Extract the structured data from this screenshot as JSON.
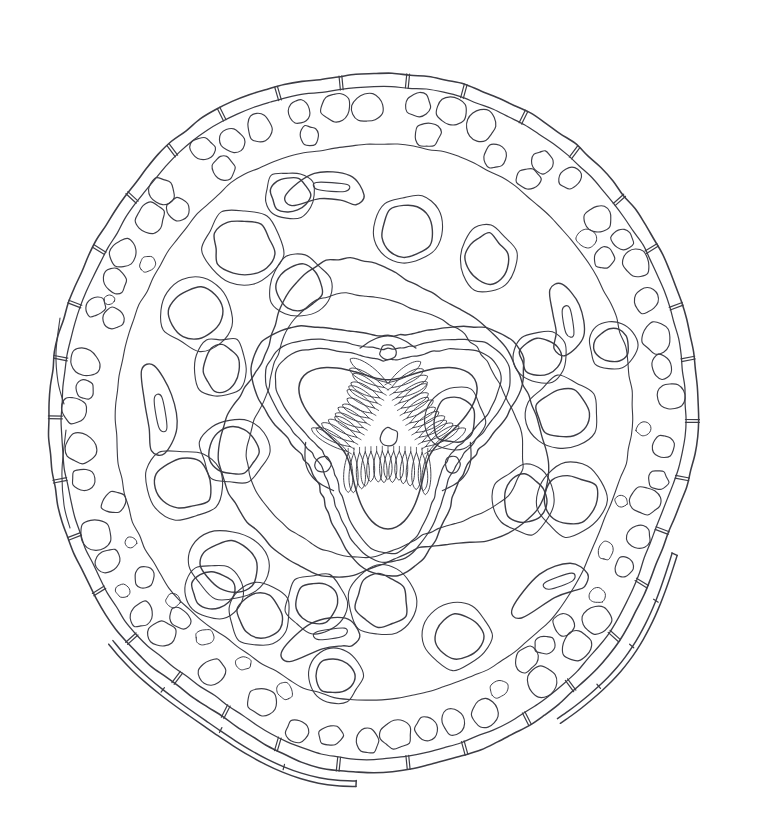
{
  "figure": {
    "kind": "scientific-line-drawing",
    "title_visible": false,
    "labels_visible": false,
    "caption_visible": false,
    "background_color": "#ffffff",
    "ink_color": "#3c3c44",
    "canvas": {
      "width": 762,
      "height": 839
    }
  },
  "structures": {
    "cuticle": {
      "name": "annulated cuticle",
      "outer_radius_x": 320,
      "outer_radius_y": 348,
      "wall_thickness": 13,
      "annulation_count": 34,
      "center": {
        "x": 374,
        "y": 420
      }
    },
    "lateral_alae": {
      "name": "lateral alae / detached cuticular flaps",
      "count": 4,
      "positions": [
        "upper-left",
        "right",
        "lower-left",
        "lower-right"
      ]
    },
    "hypodermis": {
      "name": "hypodermal layer",
      "radius_x": 296,
      "radius_y": 322
    },
    "lateral_chords": {
      "name": "lateral chord",
      "count": 2
    },
    "somatic_cells": {
      "name": "peripheral muscle / storage cell ring",
      "ring_count": 2,
      "approx_cell_count": 118,
      "cell_size_range_px": [
        9,
        27
      ]
    },
    "pseudocoelom": {
      "name": "pseudocoelomic cavity"
    },
    "reproductive_tubes": {
      "name": "gonadal / intestinal tube profiles",
      "count": 22,
      "note": "rounded double-walled tube sections scattered in the body cavity"
    },
    "ribbon_organs": {
      "name": "elongate ribbon-shaped organ profiles",
      "count": 5
    },
    "pharynx": {
      "name": "triradiate pharynx (esophagus)",
      "outline_shape": "rounded triangle",
      "lumen_shape": "triradiate / Y-shaped",
      "radial_lobe_count": 46,
      "subventral_gland_pores": 3,
      "central_nucleus": true,
      "center": {
        "x": 388,
        "y": 425
      },
      "outer_half_width": 118,
      "outer_half_height": 112
    },
    "pharyngeal_sheath": {
      "name": "pharyngeal sheath / envelope ring",
      "half_width": 158,
      "half_height": 150
    }
  },
  "render_params": {
    "seed": 20240617,
    "stroke_color": "#3c3c44",
    "fill": "none",
    "line_wobble_amplitude_px": 1.6
  }
}
